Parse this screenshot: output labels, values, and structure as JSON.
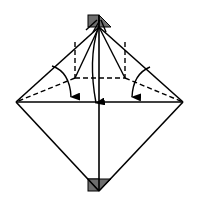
{
  "diagram": {
    "type": "origami-fold-step",
    "colors": {
      "line": "#000000",
      "background": "#ffffff",
      "paper_back": "#6e6e6e"
    },
    "elements": {
      "outline": "square-on-diamond",
      "valley_folds": 3,
      "fold_arrows": 3,
      "shaded_corners": [
        "top",
        "bottom"
      ]
    }
  }
}
